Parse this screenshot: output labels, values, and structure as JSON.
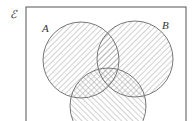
{
  "diagram": {
    "type": "venn",
    "universal_label": "ℰ",
    "sets": [
      {
        "name": "A",
        "label": "A",
        "cx": 81,
        "cy": 60,
        "r": 38,
        "hatch": "forward"
      },
      {
        "name": "B",
        "label": "B",
        "cx": 135,
        "cy": 59,
        "r": 38,
        "hatch": "forward"
      },
      {
        "name": "C",
        "label": "",
        "cx": 108,
        "cy": 106,
        "r": 38,
        "hatch": "backward"
      }
    ],
    "shading": "All regions of A, B and C shaded; overlaps with C cross-hatched",
    "colors": {
      "line": "#777777",
      "hatch": "#9a9a9a",
      "frame": "#555555",
      "background": "#ffffff"
    }
  }
}
